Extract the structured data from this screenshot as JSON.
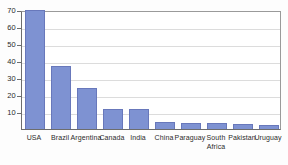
{
  "chart_data": {
    "type": "bar",
    "title": "",
    "xlabel": "",
    "ylabel": "",
    "categories": [
      "USA",
      "Brazil",
      "Argentina",
      "Canada",
      "India",
      "China",
      "Paraguay",
      "South Africa",
      "Pakistan",
      "Uruguay"
    ],
    "values": [
      70,
      37,
      24,
      12,
      11.5,
      4,
      3.5,
      3.5,
      3,
      2.5
    ],
    "ylim": [
      0,
      70
    ],
    "yticks": [
      10,
      20,
      30,
      40,
      50,
      60,
      70
    ],
    "ytick_labels": [
      "10",
      "20",
      "30",
      "40",
      "50",
      "60",
      "70"
    ],
    "grid": true,
    "grid_axis": "y",
    "legend": "none",
    "bar_color": "#7e92d2",
    "bar_edge_color": "#6878bb",
    "axis_color": "#6d6d6d",
    "grid_color": "#dcdcdc",
    "plot_background": "#ffffff",
    "figure_background": "#fdfdfd",
    "text_color": "#2b2b2b"
  },
  "x_labels": [
    {
      "line1": "USA",
      "line2": ""
    },
    {
      "line1": "Brazil",
      "line2": ""
    },
    {
      "line1": "Argentina",
      "line2": ""
    },
    {
      "line1": "Canada",
      "line2": ""
    },
    {
      "line1": "India",
      "line2": ""
    },
    {
      "line1": "China",
      "line2": ""
    },
    {
      "line1": "Paraguay",
      "line2": ""
    },
    {
      "line1": "South",
      "line2": "Africa"
    },
    {
      "line1": "Pakistan",
      "line2": ""
    },
    {
      "line1": "Uruguay",
      "line2": ""
    }
  ]
}
